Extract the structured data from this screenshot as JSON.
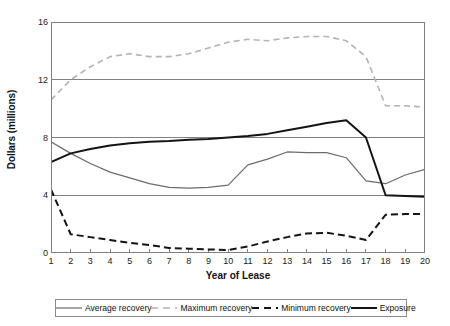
{
  "chart_data": {
    "type": "line",
    "title": "",
    "xlabel": "Year of Lease",
    "ylabel": "Dollars (millions)",
    "xlim": [
      1,
      20
    ],
    "ylim": [
      0,
      16
    ],
    "yticks": [
      0,
      4,
      8,
      12,
      16
    ],
    "ytick_labels": [
      "0",
      "4",
      "8",
      "12",
      "16"
    ],
    "grid": "horizontal",
    "legend_position": "bottom",
    "x": [
      1,
      2,
      3,
      4,
      5,
      6,
      7,
      8,
      9,
      10,
      11,
      12,
      13,
      14,
      15,
      16,
      17,
      18,
      19,
      20
    ],
    "xtick_labels": [
      "1",
      "2",
      "3",
      "4",
      "5",
      "6",
      "7",
      "8",
      "9",
      "10",
      "11",
      "12",
      "13",
      "14",
      "15",
      "16",
      "17",
      "18",
      "19",
      "20"
    ],
    "series": [
      {
        "name": "Average recovery",
        "style": "solid",
        "color": "#6b6b6b",
        "width": 1.2,
        "values": [
          7.7,
          6.9,
          6.2,
          5.6,
          5.2,
          4.8,
          4.55,
          4.5,
          4.55,
          4.7,
          6.1,
          6.5,
          7.0,
          6.95,
          6.95,
          6.6,
          5.0,
          4.8,
          5.4,
          5.8
        ]
      },
      {
        "name": "Maximum recovery",
        "style": "dashed",
        "color": "#b3b3b3",
        "width": 1.6,
        "values": [
          10.6,
          12.0,
          12.9,
          13.6,
          13.8,
          13.6,
          13.6,
          13.8,
          14.2,
          14.6,
          14.8,
          14.7,
          14.9,
          15.0,
          15.0,
          14.7,
          13.6,
          10.2,
          10.2,
          10.1
        ]
      },
      {
        "name": "Minimum recovery",
        "style": "dashed",
        "color": "#141414",
        "width": 2.0,
        "values": [
          4.4,
          1.3,
          1.1,
          0.9,
          0.7,
          0.55,
          0.35,
          0.3,
          0.25,
          0.2,
          0.45,
          0.8,
          1.1,
          1.35,
          1.4,
          1.2,
          0.9,
          2.65,
          2.7,
          2.7
        ]
      },
      {
        "name": "Exposure",
        "style": "solid",
        "color": "#141414",
        "width": 2.0,
        "values": [
          6.3,
          6.9,
          7.2,
          7.45,
          7.6,
          7.7,
          7.75,
          7.85,
          7.9,
          8.0,
          8.1,
          8.25,
          8.5,
          8.75,
          9.0,
          9.2,
          8.0,
          4.0,
          3.95,
          3.9
        ]
      }
    ]
  },
  "legend": {
    "items": [
      {
        "label": "Average recovery"
      },
      {
        "label": "Maximum recovery"
      },
      {
        "label": "Minimum recovery"
      },
      {
        "label": "Exposure"
      }
    ]
  },
  "colors": {
    "axis": "#808080",
    "grid": "#808080",
    "background": "#ffffff",
    "text": "#1a1a1a"
  }
}
